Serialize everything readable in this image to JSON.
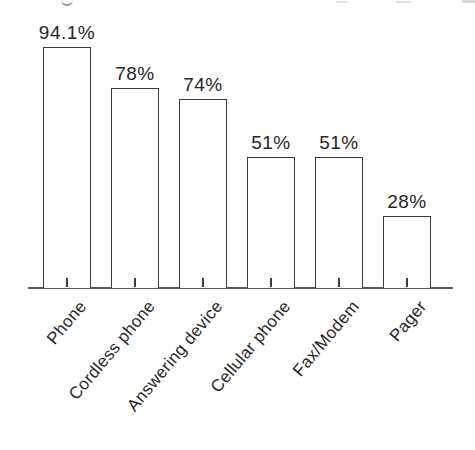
{
  "chart_data": {
    "type": "bar",
    "title": "",
    "xlabel": "",
    "ylabel": "",
    "categories": [
      "Phone",
      "Cordless phone",
      "Answering device",
      "Cellular phone",
      "Fax/Modem",
      "Pager"
    ],
    "values": [
      94.1,
      78,
      74,
      51,
      51,
      28
    ],
    "value_labels": [
      "94.1%",
      "78%",
      "74%",
      "51%",
      "51%",
      "28%"
    ],
    "ylim": [
      0,
      100
    ],
    "grid": false,
    "legend": "none",
    "orientation": "vertical",
    "category_label_rotation_deg": 50,
    "bar_fill": "#ffffff",
    "bar_border_color": "#3b3b3b",
    "axis_color": "#5c5c5c",
    "text_color": "#262626",
    "background_color": "#ffffff"
  }
}
